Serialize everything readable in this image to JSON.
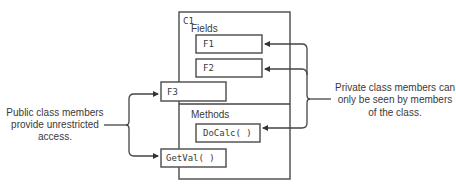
{
  "class": {
    "name": "C1",
    "fields_label": "Fields",
    "methods_label": "Methods",
    "private_fields": [
      "F1",
      "F2"
    ],
    "public_field": "F3",
    "private_method": "DoCalc( )",
    "public_method": "GetVal( )"
  },
  "annotations": {
    "public": [
      "Public class members",
      "provide unrestricted",
      "access."
    ],
    "private": [
      "Private class members can",
      "only be seen by members",
      "of the class."
    ]
  },
  "colors": {
    "stroke": "#555555",
    "text": "#3a3a3a",
    "background": "#ffffff"
  }
}
